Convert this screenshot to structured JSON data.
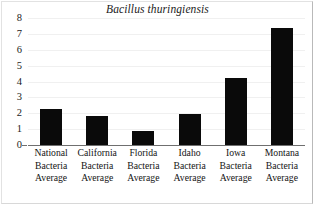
{
  "chart_data": {
    "type": "bar",
    "title": "Bacillus thuringiensis",
    "xlabel": "",
    "ylabel": "",
    "ylim": [
      0,
      8
    ],
    "yticks": [
      0,
      1,
      2,
      3,
      4,
      5,
      6,
      7,
      8
    ],
    "grid": true,
    "legend": false,
    "bar_color": "#0a0a0a",
    "categories": [
      "National Bacteria Average",
      "California Bacteria Average",
      "Florida Bacteria Average",
      "Idaho Bacteria Average",
      "Iowa Bacteria Average",
      "Montana Bacteria Average"
    ],
    "category_lines": [
      [
        "National",
        "Bacteria",
        "Average"
      ],
      [
        "California",
        "Bacteria",
        "Average"
      ],
      [
        "Florida",
        "Bacteria",
        "Average"
      ],
      [
        "Idaho",
        "Bacteria",
        "Average"
      ],
      [
        "Iowa",
        "Bacteria",
        "Average"
      ],
      [
        "Montana",
        "Bacteria",
        "Average"
      ]
    ],
    "values": [
      2.25,
      1.8,
      0.9,
      1.95,
      4.25,
      7.4
    ]
  }
}
